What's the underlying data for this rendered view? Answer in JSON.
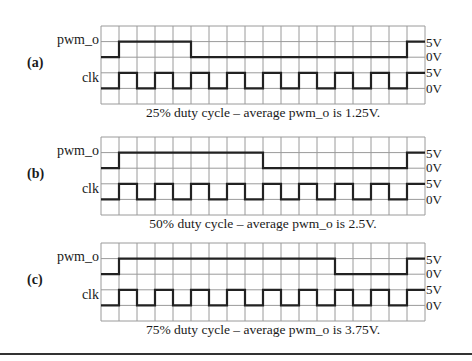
{
  "figure": {
    "grid": {
      "columns": 18,
      "rows": 5,
      "col_width": 18,
      "left": 101,
      "color": "#9a9a9a",
      "trace_color": "#222222"
    },
    "panels": [
      {
        "id": "a",
        "label": "(a)",
        "signals": {
          "pwm": "pwm_o",
          "clk": "clk"
        },
        "voltage_labels": [
          "5V",
          "0V",
          "5V",
          "0V"
        ],
        "duty_cycle_percent": 25,
        "pwm_high_cols": [
          1,
          5
        ],
        "pwm_second_rise_col": 17,
        "caption": "25% duty cycle – average pwm_o is 1.25V."
      },
      {
        "id": "b",
        "label": "(b)",
        "signals": {
          "pwm": "pwm_o",
          "clk": "clk"
        },
        "voltage_labels": [
          "5V",
          "0V",
          "5V",
          "0V"
        ],
        "duty_cycle_percent": 50,
        "pwm_high_cols": [
          1,
          9
        ],
        "pwm_second_rise_col": 17,
        "caption": "50% duty cycle – average pwm_o is 2.5V."
      },
      {
        "id": "c",
        "label": "(c)",
        "signals": {
          "pwm": "pwm_o",
          "clk": "clk"
        },
        "voltage_labels": [
          "5V",
          "0V",
          "5V",
          "0V"
        ],
        "duty_cycle_percent": 75,
        "pwm_high_cols": [
          1,
          13
        ],
        "pwm_second_rise_col": 17,
        "caption": "75% duty cycle – average pwm_o is 3.75V."
      }
    ]
  }
}
